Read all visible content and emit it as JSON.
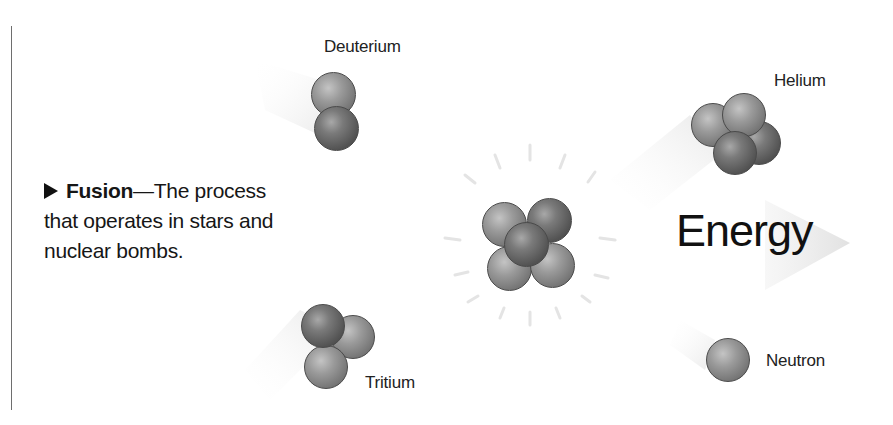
{
  "caption": {
    "bullet_icon": "right-triangle",
    "term": "Fusion",
    "dash": "—",
    "definition_line1": "The process",
    "definition_line2": "that operates in stars and",
    "definition_line3": "nuclear bombs."
  },
  "labels": {
    "deuterium": "Deuterium",
    "tritium": "Tritium",
    "helium": "Helium",
    "neutron": "Neutron",
    "energy": "Energy"
  },
  "colors": {
    "background": "#ffffff",
    "text": "#111111",
    "sphere_light": "#9a9a9a",
    "sphere_dark": "#555555",
    "rule": "#6e6e6e"
  }
}
